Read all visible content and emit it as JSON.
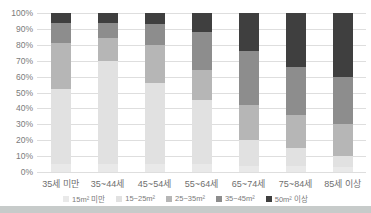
{
  "chart_data": {
    "type": "bar",
    "stacked": true,
    "percent_stacked": true,
    "title": "",
    "xlabel": "",
    "ylabel": "",
    "ylim": [
      0,
      100
    ],
    "grid": "horizontal",
    "legend_position": "bottom",
    "categories": [
      "35세 미만",
      "35~44세",
      "45~54세",
      "55~64세",
      "65~74세",
      "75~84세",
      "85세 이상"
    ],
    "series": [
      {
        "name": "15m² 미만",
        "color": "#e9e9e9",
        "values": [
          5,
          5,
          5,
          5,
          4,
          4,
          3
        ]
      },
      {
        "name": "15~25m²",
        "color": "#e1e1e1",
        "values": [
          47,
          65,
          51,
          40,
          16,
          11,
          7
        ]
      },
      {
        "name": "25~35m²",
        "color": "#b6b6b6",
        "values": [
          29,
          14,
          24,
          19,
          22,
          21,
          20
        ]
      },
      {
        "name": "35~45m²",
        "color": "#8d8d8d",
        "values": [
          13,
          10,
          13,
          24,
          34,
          30,
          30
        ]
      },
      {
        "name": "50m² 이상",
        "color": "#3f3f3f",
        "values": [
          6,
          6,
          7,
          12,
          24,
          34,
          40
        ]
      }
    ],
    "yticks": [
      "0%",
      "10%",
      "20%",
      "30%",
      "40%",
      "50%",
      "60%",
      "70%",
      "80%",
      "90%",
      "100%"
    ],
    "colors": {
      "gridline": "#dedede",
      "axis_text": "#7b7b7b",
      "legend_text": "#7b7b7b",
      "background": "#ffffff",
      "bottom_strip": "#c7cbca"
    }
  }
}
